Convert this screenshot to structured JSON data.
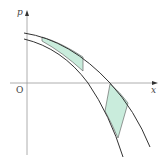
{
  "figure": {
    "axes": {
      "x_label": "x",
      "y_label": "p",
      "origin_label": "O"
    },
    "curves": [
      {
        "name": "upper-curve",
        "description": "outer decreasing concave curve"
      },
      {
        "name": "lower-curve",
        "description": "inner decreasing concave curve"
      }
    ],
    "shaded_regions": [
      {
        "name": "upper-shaded-region",
        "position": "above x-axis, between curves"
      },
      {
        "name": "lower-shaded-region",
        "position": "below x-axis, between curves"
      }
    ],
    "colors": {
      "line": "#333333",
      "axis": "#888888",
      "fill": "#c9ecdc"
    }
  }
}
